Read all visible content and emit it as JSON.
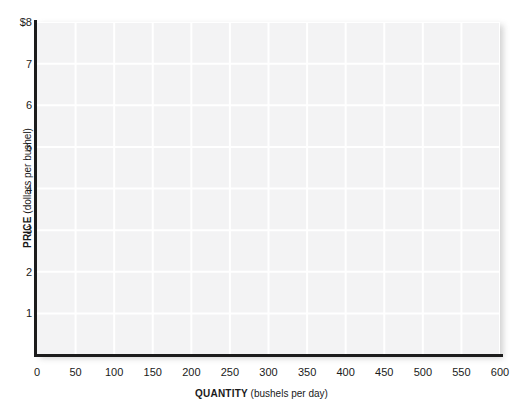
{
  "chart_data": {
    "type": "line",
    "title": "",
    "subtitle": "",
    "xlabel_strong": "QUANTITY",
    "xlabel_soft": "(bushels per day)",
    "ylabel_strong": "PRICE",
    "ylabel_soft": "(dollars per bushel)",
    "xlim": [
      0,
      600
    ],
    "ylim": [
      0,
      8
    ],
    "x_ticks": [
      "0",
      "50",
      "100",
      "150",
      "200",
      "250",
      "300",
      "350",
      "400",
      "450",
      "500",
      "550",
      "600"
    ],
    "x_tick_values": [
      0,
      50,
      100,
      150,
      200,
      250,
      300,
      350,
      400,
      450,
      500,
      550,
      600
    ],
    "y_ticks": [
      "$8",
      "7",
      "6",
      "5",
      "4",
      "3",
      "2",
      "1"
    ],
    "y_tick_values": [
      8,
      7,
      6,
      5,
      4,
      3,
      2,
      1
    ],
    "grid": true,
    "grid_color": "#ffffff",
    "plot_background": "#f3f3f4",
    "axis_color": "#1c1c1c",
    "legend": [],
    "series": [],
    "annotations": [],
    "note": "Empty grid — blank axes provided for plotting; no data curves are drawn."
  },
  "caption": {
    "top_cut_text": ""
  }
}
